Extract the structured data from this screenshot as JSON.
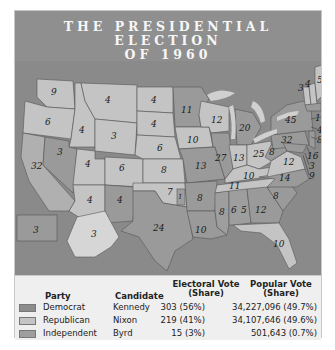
{
  "title_line1": "THE PRESIDENTIAL ELECTION",
  "title_line2": "OF 1960",
  "colors": {
    "democrat": "#8c8c8c",
    "republican": "#c4c4c4",
    "independent": "#9e9e9e",
    "water": "#8a8a8a",
    "title_bar": "#8f8f8f"
  },
  "map": {
    "state_electoral_votes": [
      {
        "state": "WA",
        "ev": "9"
      },
      {
        "state": "OR",
        "ev": "6"
      },
      {
        "state": "CA",
        "ev": "32"
      },
      {
        "state": "ID",
        "ev": "4"
      },
      {
        "state": "NV",
        "ev": "3"
      },
      {
        "state": "MT",
        "ev": "4"
      },
      {
        "state": "WY",
        "ev": "3"
      },
      {
        "state": "UT",
        "ev": "4"
      },
      {
        "state": "AZ",
        "ev": "4"
      },
      {
        "state": "CO",
        "ev": "6"
      },
      {
        "state": "NM",
        "ev": "4"
      },
      {
        "state": "ND",
        "ev": "4"
      },
      {
        "state": "SD",
        "ev": "4"
      },
      {
        "state": "NE",
        "ev": "6"
      },
      {
        "state": "KS",
        "ev": "8"
      },
      {
        "state": "OK",
        "ev": "7"
      },
      {
        "state": "OK-Byrd",
        "ev": "1"
      },
      {
        "state": "TX",
        "ev": "24"
      },
      {
        "state": "MN",
        "ev": "11"
      },
      {
        "state": "IA",
        "ev": "10"
      },
      {
        "state": "MO",
        "ev": "13"
      },
      {
        "state": "AR",
        "ev": "8"
      },
      {
        "state": "LA",
        "ev": "10"
      },
      {
        "state": "WI",
        "ev": "12"
      },
      {
        "state": "IL",
        "ev": "27"
      },
      {
        "state": "MI",
        "ev": "20"
      },
      {
        "state": "IN",
        "ev": "13"
      },
      {
        "state": "OH",
        "ev": "25"
      },
      {
        "state": "KY",
        "ev": "10"
      },
      {
        "state": "TN",
        "ev": "11"
      },
      {
        "state": "MS",
        "ev": "8"
      },
      {
        "state": "AL-Kennedy",
        "ev": "5"
      },
      {
        "state": "AL-Byrd",
        "ev": "6"
      },
      {
        "state": "GA",
        "ev": "12"
      },
      {
        "state": "FL",
        "ev": "10"
      },
      {
        "state": "SC",
        "ev": "8"
      },
      {
        "state": "NC",
        "ev": "14"
      },
      {
        "state": "VA",
        "ev": "12"
      },
      {
        "state": "WV",
        "ev": "8"
      },
      {
        "state": "PA",
        "ev": "32"
      },
      {
        "state": "NY",
        "ev": "45"
      },
      {
        "state": "VT",
        "ev": "3"
      },
      {
        "state": "NH",
        "ev": "4"
      },
      {
        "state": "ME",
        "ev": "5"
      },
      {
        "state": "MA",
        "ev": "16"
      },
      {
        "state": "RI",
        "ev": "4"
      },
      {
        "state": "CT",
        "ev": "8"
      },
      {
        "state": "NJ",
        "ev": "16"
      },
      {
        "state": "DE",
        "ev": "3"
      },
      {
        "state": "MD",
        "ev": "9"
      },
      {
        "state": "AK",
        "ev": "3"
      },
      {
        "state": "HI",
        "ev": "3"
      }
    ]
  },
  "legend": {
    "headers": {
      "party": "Party",
      "candidate": "Candidate",
      "ev_line1": "Electoral Vote",
      "ev_line2": "(Share)",
      "pop_line1": "Popular Vote",
      "pop_line2": "(Share)"
    },
    "rows": [
      {
        "party": "Democrat",
        "candidate": "Kennedy",
        "electoral": "303 (56%)",
        "popular": "34,227,096 (49.7%)"
      },
      {
        "party": "Republican",
        "candidate": "Nixon",
        "electoral": "219 (41%)",
        "popular": "34,107,646 (49.6%)"
      },
      {
        "party": "Independent",
        "candidate": "Byrd",
        "electoral": "15 (3%)",
        "popular": "501,643 (0.7%)"
      }
    ]
  }
}
